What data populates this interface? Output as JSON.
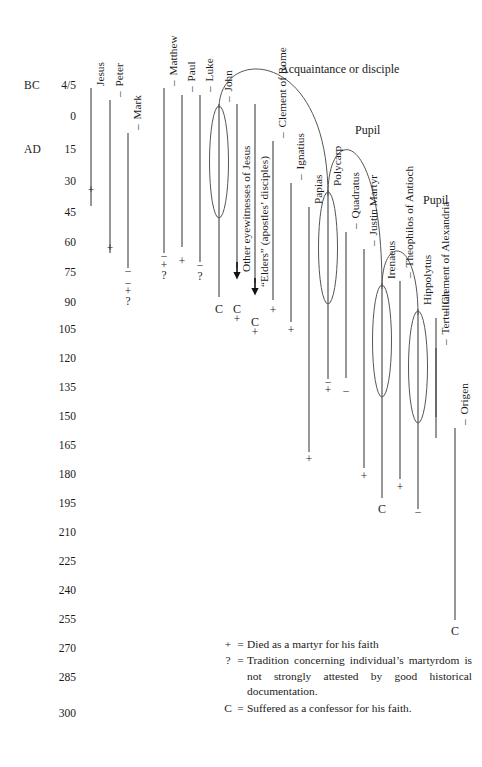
{
  "axis": {
    "era_bc": "BC",
    "era_ad": "AD",
    "ticks": [
      {
        "label": "4/5",
        "y": 86
      },
      {
        "label": "0",
        "y": 117
      },
      {
        "label": "15",
        "y": 150
      },
      {
        "label": "30",
        "y": 182
      },
      {
        "label": "45",
        "y": 213
      },
      {
        "label": "60",
        "y": 243
      },
      {
        "label": "75",
        "y": 273
      },
      {
        "label": "90",
        "y": 303
      },
      {
        "label": "105",
        "y": 330
      },
      {
        "label": "120",
        "y": 359
      },
      {
        "label": "135",
        "y": 388
      },
      {
        "label": "150",
        "y": 417
      },
      {
        "label": "165",
        "y": 446
      },
      {
        "label": "180",
        "y": 475
      },
      {
        "label": "195",
        "y": 504
      },
      {
        "label": "210",
        "y": 533
      },
      {
        "label": "225",
        "y": 562
      },
      {
        "label": "240",
        "y": 591
      },
      {
        "label": "255",
        "y": 620
      },
      {
        "label": "270",
        "y": 649
      },
      {
        "label": "285",
        "y": 678
      },
      {
        "label": "300",
        "y": 714
      }
    ]
  },
  "people": [
    {
      "name": "Jesus",
      "x": 91,
      "label_y": 86,
      "top": 88,
      "bottom": 206,
      "dash": false,
      "circled": false,
      "markers": [
        {
          "sym": "+",
          "y": 191
        }
      ]
    },
    {
      "name": "Peter",
      "x": 110,
      "label_y": 97,
      "top": 100,
      "bottom": 253,
      "dash": true,
      "circled": false,
      "markers": [
        {
          "sym": "+",
          "y": 249
        }
      ]
    },
    {
      "name": "Mark",
      "x": 128,
      "label_y": 130,
      "top": 133,
      "bottom": 268,
      "dash": true,
      "circled": false,
      "markers": [
        {
          "sym": "–",
          "y": 271
        },
        {
          "sym": "–",
          "y": 283
        },
        {
          "sym": "+",
          "y": 292
        },
        {
          "sym": "?",
          "y": 302
        }
      ]
    },
    {
      "name": "Matthew",
      "x": 164,
      "label_y": 86,
      "top": 88,
      "bottom": 253,
      "dash": true,
      "circled": false,
      "markers": [
        {
          "sym": "–",
          "y": 256
        },
        {
          "sym": "+",
          "y": 266
        },
        {
          "sym": "?",
          "y": 276
        }
      ]
    },
    {
      "name": "Paul",
      "x": 182,
      "label_y": 92,
      "top": 95,
      "bottom": 247,
      "dash": true,
      "circled": false,
      "markers": [
        {
          "sym": "+",
          "y": 262
        }
      ]
    },
    {
      "name": "Luke",
      "x": 200,
      "label_y": 92,
      "top": 95,
      "bottom": 262,
      "dash": true,
      "circled": false,
      "markers": [
        {
          "sym": "–",
          "y": 265
        },
        {
          "sym": "?",
          "y": 277
        }
      ]
    },
    {
      "name": "John",
      "x": 219,
      "label_y": 102,
      "top": 104,
      "bottom": 297,
      "dash": true,
      "circled": true,
      "markers": [
        {
          "sym": "C",
          "y": 309
        }
      ]
    },
    {
      "name": "Other eyewitnesses of Jesus",
      "x": 237,
      "label_y": 272,
      "top": 104,
      "bottom": 268,
      "dash": false,
      "circled": false,
      "arrow_y": 276,
      "markers": [
        {
          "sym": "C",
          "y": 309
        },
        {
          "sym": "+",
          "y": 320
        }
      ]
    },
    {
      "name": "“Elders” (apostles’ disciples)",
      "x": 255,
      "label_y": 287,
      "top": 104,
      "bottom": 283,
      "dash": false,
      "circled": false,
      "arrow_y": 292,
      "markers": [
        {
          "sym": "C",
          "y": 322
        },
        {
          "sym": "+",
          "y": 333
        }
      ]
    },
    {
      "name": "Clement of Rome",
      "x": 273,
      "label_y": 138,
      "top": 141,
      "bottom": 300,
      "dash": true,
      "circled": false,
      "markers": [
        {
          "sym": "+",
          "y": 311
        }
      ]
    },
    {
      "name": "Ignatius",
      "x": 291,
      "label_y": 180,
      "top": 183,
      "bottom": 322,
      "dash": true,
      "circled": false,
      "markers": [
        {
          "sym": "+",
          "y": 331
        }
      ]
    },
    {
      "name": "Papias",
      "x": 309,
      "label_y": 204,
      "top": 207,
      "bottom": 452,
      "dash": false,
      "circled": false,
      "markers": [
        {
          "sym": "+",
          "y": 460
        }
      ]
    },
    {
      "name": "Polycarp",
      "x": 328,
      "label_y": 186,
      "top": 190,
      "bottom": 379,
      "dash": false,
      "circled": true,
      "markers": [
        {
          "sym": "–",
          "y": 382
        },
        {
          "sym": "+",
          "y": 391
        }
      ]
    },
    {
      "name": "Quadratus",
      "x": 346,
      "label_y": 229,
      "top": 232,
      "bottom": 378,
      "dash": true,
      "circled": false,
      "markers": [
        {
          "sym": "–",
          "y": 391
        }
      ]
    },
    {
      "name": "Justin Martyr",
      "x": 364,
      "label_y": 246,
      "top": 249,
      "bottom": 468,
      "dash": true,
      "circled": false,
      "markers": [
        {
          "sym": "+",
          "y": 477
        }
      ]
    },
    {
      "name": "Irenaeus",
      "x": 382,
      "label_y": 279,
      "top": 283,
      "bottom": 498,
      "dash": false,
      "circled": true,
      "markers": [
        {
          "sym": "C",
          "y": 509
        }
      ]
    },
    {
      "name": "Theophilos of Antioch",
      "x": 400,
      "label_y": 278,
      "top": 281,
      "bottom": 479,
      "dash": true,
      "circled": false,
      "markers": [
        {
          "sym": "+",
          "y": 488
        }
      ]
    },
    {
      "name": "Hippolytus",
      "x": 418,
      "label_y": 305,
      "top": 309,
      "bottom": 509,
      "dash": false,
      "circled": true,
      "markers": [
        {
          "sym": "–",
          "y": 512
        }
      ]
    },
    {
      "name": "Clement of Alexandria",
      "x": 436,
      "label_y": 315,
      "top": 318,
      "bottom": 417,
      "dash": true,
      "circled": false,
      "markers": []
    },
    {
      "name": "Tertullian",
      "x": 436,
      "label_y": 345,
      "top": 348,
      "bottom": 438,
      "dash": true,
      "circled": false,
      "markers": []
    },
    {
      "name": "Origen",
      "x": 455,
      "label_y": 425,
      "top": 428,
      "bottom": 620,
      "dash": true,
      "circled": false,
      "markers": [
        {
          "sym": "C",
          "y": 631
        }
      ]
    }
  ],
  "annotations": [
    {
      "text": "Acquaintance or disciple",
      "x": 280,
      "y": 62
    },
    {
      "text": "Pupil",
      "x": 355,
      "y": 123
    },
    {
      "text": "Pupil",
      "x": 423,
      "y": 193
    }
  ],
  "legend": [
    {
      "sym": "+",
      "eq": "=",
      "text": "Died as a martyr for his faith",
      "justify": false
    },
    {
      "sym": "?",
      "eq": "=",
      "text": "Tradition concerning individual’s martyrdom is not strongly attested by good historical documentation.",
      "justify": true
    },
    {
      "sym": "C",
      "eq": "=",
      "text": "Suffered as a confessor for his faith.",
      "justify": false
    }
  ],
  "style": {
    "line_color": "#4a4a4a",
    "arc_color": "#555555",
    "text_color": "#1a1a1a"
  }
}
